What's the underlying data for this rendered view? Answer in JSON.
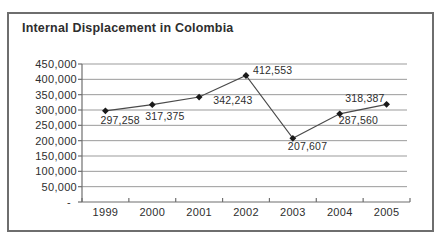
{
  "chart_data": {
    "type": "line",
    "title": "Internal Displacement in Colombia",
    "categories": [
      "1999",
      "2000",
      "2001",
      "2002",
      "2003",
      "2004",
      "2005"
    ],
    "values": [
      297258,
      317375,
      342243,
      412553,
      207607,
      287560,
      318387
    ],
    "data_labels": [
      "297,258",
      "317,375",
      "342,243",
      "412,553",
      "207,607",
      "287,560",
      "318,387"
    ],
    "y_tick_values": [
      450000,
      400000,
      350000,
      300000,
      250000,
      200000,
      150000,
      100000,
      50000,
      0
    ],
    "y_tick_labels": [
      "450,000",
      "400,000",
      "350,000",
      "300,000",
      "250,000",
      "200,000",
      "150,000",
      "100,000",
      "50,000",
      "-"
    ],
    "ylim": [
      0,
      450000
    ],
    "xlabel": "",
    "ylabel": "",
    "grid": "horizontal",
    "legend": "none",
    "marker": "diamond",
    "colors": {
      "line": "#4a4a4a",
      "marker": "#1a1a1a",
      "gridline": "#9b9b9b",
      "axis": "#6f6f6f",
      "text": "#2e2e2e",
      "panel_border": "#6e6e6e",
      "background": "#ffffff"
    }
  }
}
